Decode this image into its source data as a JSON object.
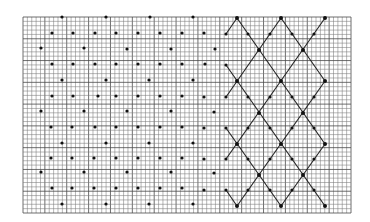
{
  "figure": {
    "colors": {
      "background": "#ffffff",
      "grid": "#7a7a7a",
      "grid_major": "#4a4a4a",
      "dot": "#111111",
      "line": "#222222"
    },
    "grid": {
      "x0": 23,
      "y0": 17,
      "x1": 351,
      "y1": 213,
      "cell": 4.35
    },
    "dots": [
      [
        62,
        17
      ],
      [
        106,
        17
      ],
      [
        150,
        17
      ],
      [
        193,
        17
      ],
      [
        52,
        33
      ],
      [
        73,
        33
      ],
      [
        95,
        33
      ],
      [
        116,
        33
      ],
      [
        138,
        33
      ],
      [
        160,
        33
      ],
      [
        182,
        33
      ],
      [
        204,
        33
      ],
      [
        226,
        34
      ],
      [
        248,
        34
      ],
      [
        270,
        34
      ],
      [
        292,
        34
      ],
      [
        314,
        34
      ],
      [
        41,
        48
      ],
      [
        84,
        48
      ],
      [
        127,
        49
      ],
      [
        171,
        49
      ],
      [
        215,
        49
      ],
      [
        52,
        64
      ],
      [
        73,
        64
      ],
      [
        95,
        64
      ],
      [
        116,
        64
      ],
      [
        138,
        64
      ],
      [
        160,
        64
      ],
      [
        182,
        64
      ],
      [
        205,
        64
      ],
      [
        226,
        65
      ],
      [
        62,
        80
      ],
      [
        106,
        80
      ],
      [
        149,
        80
      ],
      [
        193,
        80
      ],
      [
        52,
        96
      ],
      [
        73,
        96
      ],
      [
        98,
        96
      ],
      [
        116,
        96
      ],
      [
        138,
        96
      ],
      [
        160,
        96
      ],
      [
        182,
        96
      ],
      [
        204,
        97
      ],
      [
        226,
        97
      ],
      [
        248,
        97
      ],
      [
        270,
        97
      ],
      [
        292,
        97
      ],
      [
        314,
        97
      ],
      [
        41,
        111
      ],
      [
        84,
        111
      ],
      [
        127,
        111
      ],
      [
        171,
        111
      ],
      [
        214,
        112
      ],
      [
        51,
        127
      ],
      [
        72,
        127
      ],
      [
        95,
        127
      ],
      [
        116,
        127
      ],
      [
        138,
        127
      ],
      [
        160,
        127
      ],
      [
        182,
        127
      ],
      [
        204,
        128
      ],
      [
        226,
        128
      ],
      [
        248,
        128
      ],
      [
        270,
        128
      ],
      [
        292,
        128
      ],
      [
        314,
        128
      ],
      [
        62,
        143
      ],
      [
        106,
        143
      ],
      [
        149,
        143
      ],
      [
        193,
        143
      ],
      [
        51,
        158
      ],
      [
        72,
        158
      ],
      [
        94,
        158
      ],
      [
        116,
        158
      ],
      [
        138,
        158
      ],
      [
        160,
        158
      ],
      [
        182,
        158
      ],
      [
        204,
        159
      ],
      [
        226,
        159
      ],
      [
        248,
        159
      ],
      [
        270,
        159
      ],
      [
        292,
        159
      ],
      [
        314,
        159
      ],
      [
        41,
        172
      ],
      [
        84,
        172
      ],
      [
        127,
        172
      ],
      [
        171,
        172
      ],
      [
        214,
        173
      ],
      [
        52,
        188
      ],
      [
        72,
        188
      ],
      [
        94,
        188
      ],
      [
        116,
        188
      ],
      [
        138,
        188
      ],
      [
        160,
        188
      ],
      [
        182,
        188
      ],
      [
        204,
        190
      ],
      [
        226,
        190
      ],
      [
        248,
        190
      ],
      [
        270,
        190
      ],
      [
        292,
        190
      ],
      [
        314,
        190
      ],
      [
        62,
        204
      ],
      [
        106,
        204
      ],
      [
        149,
        204
      ],
      [
        193,
        204
      ]
    ],
    "vertices": [
      [
        237,
        18
      ],
      [
        281,
        18
      ],
      [
        325,
        18
      ],
      [
        259,
        50
      ],
      [
        303,
        50
      ],
      [
        237,
        81
      ],
      [
        281,
        81
      ],
      [
        325,
        81
      ],
      [
        259,
        113
      ],
      [
        303,
        113
      ],
      [
        237,
        144
      ],
      [
        281,
        144
      ],
      [
        325,
        144
      ],
      [
        259,
        175
      ],
      [
        303,
        175
      ],
      [
        237,
        206
      ],
      [
        281,
        206
      ],
      [
        325,
        206
      ]
    ],
    "lines": [
      [
        [
          226,
          34
        ],
        [
          237,
          18
        ]
      ],
      [
        [
          237,
          18
        ],
        [
          325,
          144
        ]
      ],
      [
        [
          281,
          18
        ],
        [
          325,
          81
        ]
      ],
      [
        [
          226,
          65
        ],
        [
          325,
          206
        ]
      ],
      [
        [
          226,
          128
        ],
        [
          281,
          206
        ]
      ],
      [
        [
          325,
          18
        ],
        [
          226,
          159
        ]
      ],
      [
        [
          281,
          18
        ],
        [
          226,
          97
        ]
      ],
      [
        [
          325,
          81
        ],
        [
          237,
          206
        ]
      ],
      [
        [
          325,
          144
        ],
        [
          281,
          206
        ]
      ],
      [
        [
          226,
          190
        ],
        [
          237,
          206
        ]
      ]
    ]
  }
}
